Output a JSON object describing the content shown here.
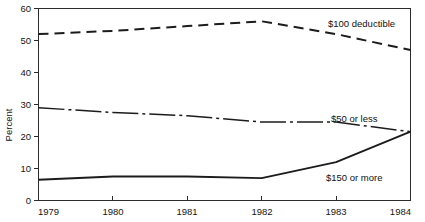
{
  "chart_data": {
    "type": "line",
    "title": "",
    "xlabel": "",
    "ylabel": "Percent",
    "x": [
      1979,
      1980,
      1981,
      1982,
      1983,
      1984
    ],
    "xticklabels": [
      "1979",
      "1980",
      "1981",
      "1982",
      "1983",
      "1984"
    ],
    "xlim": [
      1979,
      1984
    ],
    "ylim": [
      0,
      60
    ],
    "yticks": [
      0,
      10,
      20,
      30,
      40,
      50,
      60
    ],
    "yticklabels": [
      "0",
      "10",
      "20",
      "30",
      "40",
      "50",
      "60"
    ],
    "grid": false,
    "legend_position": "inline-right",
    "series": [
      {
        "name": "$100 deductible",
        "style": "dashed",
        "values": [
          52,
          53,
          54.5,
          56,
          52,
          47
        ]
      },
      {
        "name": "$50 or less",
        "style": "dash-dot",
        "values": [
          29,
          27.5,
          26.5,
          24.5,
          24.5,
          21.5
        ]
      },
      {
        "name": "$150 or more",
        "style": "solid",
        "values": [
          6.5,
          7.5,
          7.5,
          7,
          12,
          21.5
        ]
      }
    ],
    "annotations": [
      {
        "text": "$100 deductible",
        "x": 1983.05,
        "y": 55.5
      },
      {
        "text": "$50 or less",
        "x": 1983.1,
        "y": 27.2
      },
      {
        "text": "$150 or more",
        "x": 1982.7,
        "y": 9.0
      }
    ],
    "colors": {
      "axis": "#2b2b2b",
      "series": "#1c1c1c",
      "background": "#ffffff"
    }
  },
  "axis": {
    "y_title": "Percent",
    "y_ticks": [
      "60",
      "50",
      "40",
      "30",
      "20",
      "10",
      "0"
    ],
    "x_ticks": [
      "1979",
      "1980",
      "1981",
      "1982",
      "1983",
      "1984"
    ]
  },
  "labels": {
    "series_100": "$100 deductible",
    "series_50": "$50 or less",
    "series_150": "$150 or more"
  }
}
